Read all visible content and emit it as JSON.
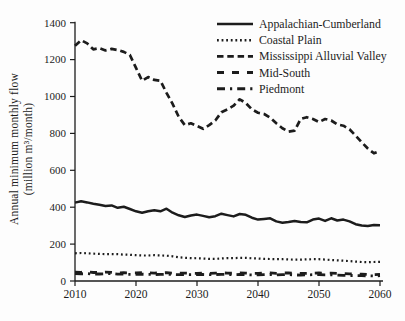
{
  "figure": {
    "background": "#fdfdfd",
    "line_color": "#1c1c1c",
    "ylabel_line1": "Annual minimum monthly flow",
    "ylabel_line2": "(million m³/month)"
  },
  "chart_data": {
    "type": "line",
    "title": "",
    "xlabel": "",
    "ylabel": "Annual minimum monthly flow (million m³/month)",
    "xlim": [
      2010,
      2060
    ],
    "ylim": [
      0,
      1400
    ],
    "xticks": [
      2010,
      2020,
      2030,
      2040,
      2050,
      2060
    ],
    "yticks": [
      0,
      200,
      400,
      600,
      800,
      1000,
      1200,
      1400
    ],
    "grid": false,
    "legend_position": "upper right",
    "x": [
      2010,
      2011,
      2012,
      2013,
      2014,
      2015,
      2016,
      2017,
      2018,
      2019,
      2020,
      2021,
      2022,
      2023,
      2024,
      2025,
      2026,
      2027,
      2028,
      2029,
      2030,
      2031,
      2032,
      2033,
      2034,
      2035,
      2036,
      2037,
      2038,
      2039,
      2040,
      2041,
      2042,
      2043,
      2044,
      2045,
      2046,
      2047,
      2048,
      2049,
      2050,
      2051,
      2052,
      2053,
      2054,
      2055,
      2056,
      2057,
      2058,
      2059,
      2060
    ],
    "series": [
      {
        "name": "Appalachian-Cumberland",
        "line_style": "solid",
        "values": [
          425,
          432,
          426,
          419,
          413,
          407,
          410,
          397,
          402,
          390,
          378,
          370,
          378,
          383,
          378,
          392,
          370,
          356,
          347,
          355,
          360,
          353,
          346,
          351,
          365,
          357,
          350,
          363,
          359,
          343,
          333,
          336,
          340,
          323,
          316,
          320,
          326,
          320,
          318,
          333,
          338,
          326,
          340,
          328,
          333,
          323,
          308,
          301,
          298,
          303,
          302
        ]
      },
      {
        "name": "Coastal Plain",
        "line_style": "dotted",
        "values": [
          150,
          152,
          150,
          148,
          147,
          146,
          146,
          145,
          143,
          142,
          140,
          138,
          138,
          140,
          139,
          137,
          134,
          129,
          126,
          124,
          123,
          122,
          120,
          120,
          122,
          124,
          124,
          125,
          125,
          123,
          122,
          120,
          119,
          118,
          118,
          117,
          116,
          116,
          117,
          118,
          118,
          116,
          114,
          112,
          110,
          108,
          105,
          103,
          102,
          103,
          104
        ]
      },
      {
        "name": "Mississippi Alluvial Valley",
        "line_style": "dashed",
        "values": [
          1275,
          1305,
          1288,
          1256,
          1262,
          1250,
          1258,
          1252,
          1242,
          1225,
          1155,
          1085,
          1105,
          1090,
          1085,
          1020,
          960,
          890,
          845,
          855,
          840,
          825,
          845,
          870,
          915,
          930,
          950,
          985,
          965,
          930,
          912,
          905,
          885,
          855,
          828,
          810,
          815,
          878,
          888,
          878,
          862,
          878,
          870,
          848,
          842,
          822,
          788,
          752,
          718,
          692,
          705
        ]
      },
      {
        "name": "Mid-South",
        "line_style": "long-dash",
        "values": [
          48,
          47,
          49,
          46,
          46,
          48,
          47,
          44,
          45,
          44,
          44,
          45,
          44,
          43,
          44,
          45,
          43,
          42,
          43,
          42,
          42,
          43,
          42,
          43,
          44,
          43,
          42,
          44,
          43,
          41,
          42,
          43,
          44,
          42,
          43,
          44,
          42,
          41,
          42,
          43,
          44,
          42,
          43,
          41,
          40,
          39,
          38,
          37,
          35,
          34,
          36
        ]
      },
      {
        "name": "Piedmont",
        "line_style": "dash-dot",
        "values": [
          40,
          39,
          40,
          38,
          38,
          39,
          40,
          37,
          37,
          36,
          36,
          37,
          36,
          35,
          36,
          37,
          35,
          34,
          35,
          34,
          34,
          35,
          34,
          35,
          36,
          35,
          34,
          35,
          34,
          33,
          33,
          34,
          35,
          33,
          34,
          35,
          33,
          32,
          33,
          34,
          34,
          33,
          33,
          32,
          31,
          30,
          30,
          29,
          28,
          27,
          29
        ]
      }
    ]
  }
}
